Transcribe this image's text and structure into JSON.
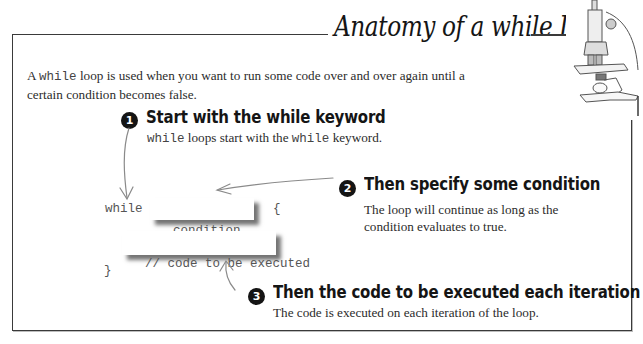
{
  "title": "Anatomy of a while Loop",
  "intro": {
    "prefix": "A ",
    "keyword": "while",
    "line1_rest": " loop is used when you want to run some code over and over again until a",
    "line2": "certain condition becomes false."
  },
  "steps": [
    {
      "number": "1",
      "heading": "Start with the while keyword",
      "description": {
        "kw1": "while",
        "mid": " loops start with the ",
        "kw2": "while",
        "end": " keyword."
      }
    },
    {
      "number": "2",
      "heading": "Then specify some condition",
      "description_lines": [
        "The loop will continue as long as the",
        "condition evaluates to true."
      ]
    },
    {
      "number": "3",
      "heading": "Then the code to be executed each iteration",
      "description": "The code is executed on each iteration of the loop."
    }
  ],
  "code": {
    "keyword": "while",
    "condition": "condition",
    "open_brace": "{",
    "body": "// code to be executed",
    "close_brace": "}"
  },
  "illustration": "microscope-icon"
}
